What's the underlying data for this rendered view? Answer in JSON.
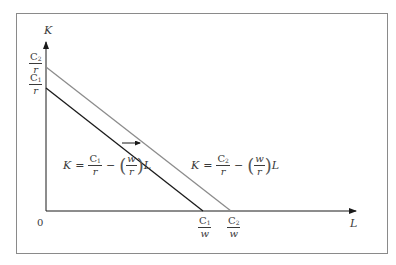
{
  "diagram": {
    "type": "isocost-lines",
    "axes": {
      "y_label": "K",
      "x_label": "L",
      "origin_label": "0"
    },
    "y_intercepts": [
      {
        "num": "C",
        "sub": "2",
        "den": "r"
      },
      {
        "num": "C",
        "sub": "1",
        "den": "r"
      }
    ],
    "x_intercepts": [
      {
        "num": "C",
        "sub": "1",
        "den": "w"
      },
      {
        "num": "C",
        "sub": "2",
        "den": "w"
      }
    ],
    "lines": [
      {
        "name": "isocost-c1",
        "color": "#1a1a1a",
        "equation": {
          "lhs": "K",
          "eq": "=",
          "c_num": "C",
          "c_sub": "1",
          "c_den": "r",
          "minus": "−",
          "w_num": "w",
          "w_den": "r",
          "var": "L"
        }
      },
      {
        "name": "isocost-c2",
        "color": "#8c8c8c",
        "equation": {
          "lhs": "K",
          "eq": "=",
          "c_num": "C",
          "c_sub": "2",
          "c_den": "r",
          "minus": "−",
          "w_num": "w",
          "w_den": "r",
          "var": "L"
        }
      }
    ],
    "shift_arrow": "right"
  }
}
